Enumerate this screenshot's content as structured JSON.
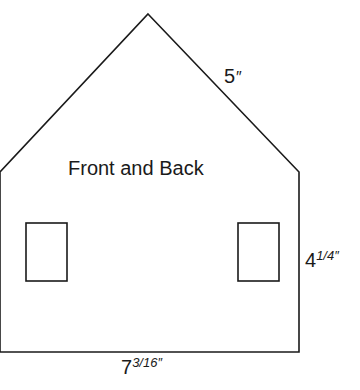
{
  "diagram": {
    "title": "Front and Back",
    "roof_edge": {
      "whole": "5",
      "unit": "″"
    },
    "wall_height": {
      "whole": "4",
      "fraction": "1/4",
      "unit": "″"
    },
    "base_width": {
      "whole": "7",
      "fraction": "3/16",
      "unit": "″"
    },
    "shape": {
      "apex": [
        148,
        14
      ],
      "left_eave": [
        0,
        172
      ],
      "right_eave": [
        299,
        172
      ],
      "bottom_left": [
        0,
        352
      ],
      "bottom_right": [
        299,
        352
      ],
      "stroke_color": "#1a1a1a"
    },
    "windows": [
      {
        "name": "left",
        "x": 26,
        "y": 223,
        "w": 41,
        "h": 58
      },
      {
        "name": "right",
        "x": 238,
        "y": 223,
        "w": 41,
        "h": 58
      }
    ]
  }
}
